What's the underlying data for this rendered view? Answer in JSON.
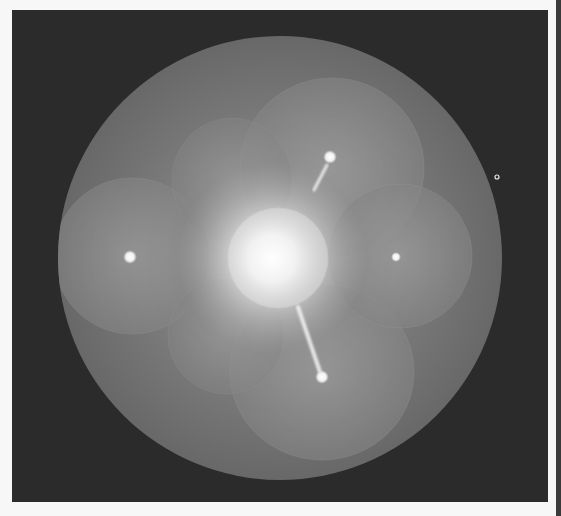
{
  "image": {
    "kind": "diffraction-pattern",
    "description": "Grayscale diffraction pattern: bright circular screen with four overlapping lobes, central bright spot, streaks and Bragg spots",
    "width": 561,
    "height": 516
  },
  "colors": {
    "page_background": "#f7f7f7",
    "frame_background": "#2b2b2b",
    "right_bar": "#3a3a3a",
    "disk": "#6f6f6f",
    "lobe": "#8a8a8a",
    "center_glow": "#f2f2f2",
    "spot": "#f4f4f4"
  },
  "frame": {
    "x": 12,
    "y": 10,
    "width": 536,
    "height": 492
  },
  "disk": {
    "cx": 280,
    "cy": 258,
    "r": 222
  },
  "center_circle": {
    "cx": 278,
    "cy": 258,
    "r": 50
  },
  "lobes": [
    {
      "name": "top",
      "cx": 332,
      "cy": 168,
      "rx": 92,
      "ry": 90
    },
    {
      "name": "bottom",
      "cx": 322,
      "cy": 372,
      "rx": 92,
      "ry": 88
    },
    {
      "name": "left",
      "cx": 132,
      "cy": 256,
      "rx": 78,
      "ry": 78
    },
    {
      "name": "right",
      "cx": 400,
      "cy": 256,
      "rx": 72,
      "ry": 72
    },
    {
      "name": "upper-left-inner",
      "cx": 232,
      "cy": 180,
      "rx": 60,
      "ry": 62
    },
    {
      "name": "lower-left-inner",
      "cx": 226,
      "cy": 336,
      "rx": 58,
      "ry": 58
    }
  ],
  "spots": [
    {
      "name": "left-spot",
      "cx": 130,
      "cy": 257,
      "r": 5
    },
    {
      "name": "top-spot",
      "cx": 330,
      "cy": 157,
      "r": 5
    },
    {
      "name": "bottom-spot",
      "cx": 322,
      "cy": 377,
      "r": 5
    },
    {
      "name": "right-spot",
      "cx": 396,
      "cy": 257,
      "r": 3
    }
  ],
  "streaks": [
    {
      "name": "left-streak",
      "x1": 193,
      "y1": 257,
      "x2": 228,
      "y2": 257,
      "w": 4
    },
    {
      "name": "right-streak",
      "x1": 343,
      "y1": 257,
      "x2": 385,
      "y2": 257,
      "w": 4
    },
    {
      "name": "top-streak",
      "x1": 327,
      "y1": 165,
      "x2": 314,
      "y2": 190,
      "w": 3
    },
    {
      "name": "bottom-streak",
      "x1": 298,
      "y1": 307,
      "x2": 320,
      "y2": 372,
      "w": 4
    }
  ],
  "marker": {
    "name": "ring-marker",
    "cx": 497,
    "cy": 177,
    "r": 2
  }
}
